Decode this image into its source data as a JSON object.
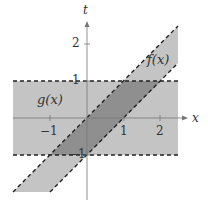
{
  "axes": {
    "x_label": "x",
    "y_label": "t",
    "x_ticks": [
      "−1",
      "1",
      "2"
    ],
    "y_ticks": [
      "2",
      "1",
      "−1"
    ]
  },
  "regions": {
    "g_label": "g(x)",
    "f_label": "f(x)"
  },
  "colors": {
    "band": "#c4c4c4",
    "overlap": "#8f8f8f",
    "axis": "#777777"
  }
}
